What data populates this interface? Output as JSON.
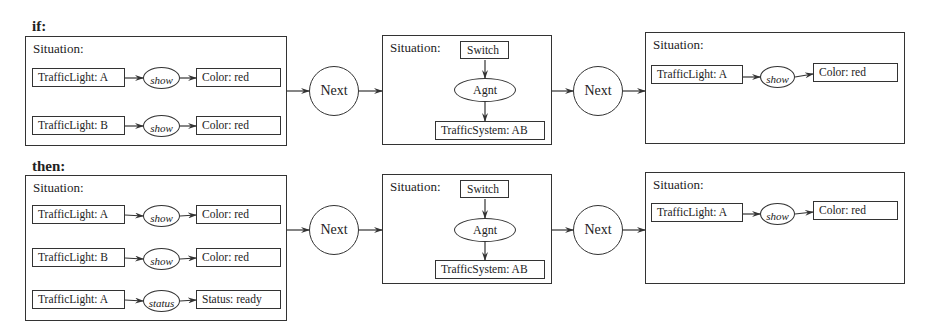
{
  "diagram": {
    "if": {
      "label": "if:",
      "situation1": {
        "label": "Situation:",
        "rows": [
          {
            "concept": "TrafficLight: A",
            "relation": "show",
            "target": "Color: red"
          },
          {
            "concept": "TrafficLight: B",
            "relation": "show",
            "target": "Color: red"
          }
        ]
      },
      "next1": "Next",
      "situation2": {
        "label": "Situation:",
        "top": "Switch",
        "relation": "Agnt",
        "bottom": "TrafficSystem: AB"
      },
      "next2": "Next",
      "situation3": {
        "label": "Situation:",
        "rows": [
          {
            "concept": "TrafficLight: A",
            "relation": "show",
            "target": "Color: red"
          }
        ]
      }
    },
    "then": {
      "label": "then:",
      "situation1": {
        "label": "Situation:",
        "rows": [
          {
            "concept": "TrafficLight: A",
            "relation": "show",
            "target": "Color: red"
          },
          {
            "concept": "TrafficLight: B",
            "relation": "show",
            "target": "Color: red"
          },
          {
            "concept": "TrafficLight: A",
            "relation": "status",
            "target": "Status: ready"
          }
        ]
      },
      "next1": "Next",
      "situation2": {
        "label": "Situation:",
        "top": "Switch",
        "relation": "Agnt",
        "bottom": "TrafficSystem: AB"
      },
      "next2": "Next",
      "situation3": {
        "label": "Situation:",
        "rows": [
          {
            "concept": "TrafficLight: A",
            "relation": "show",
            "target": "Color: red"
          }
        ]
      }
    }
  }
}
